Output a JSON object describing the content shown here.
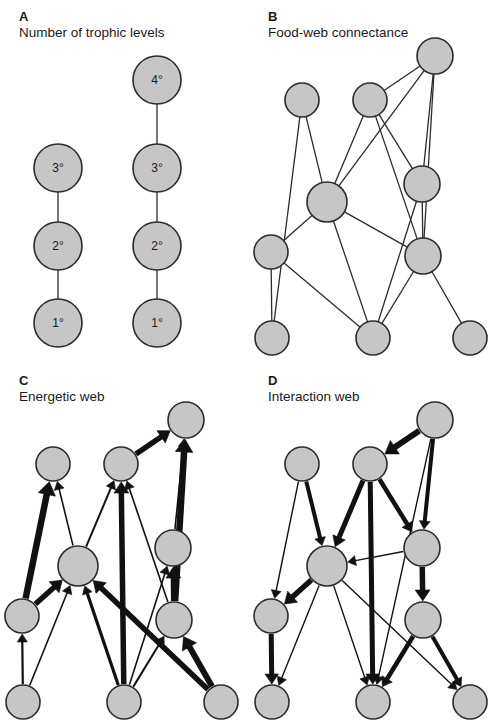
{
  "figure": {
    "background": "#ffffff",
    "node_fill": "#c6c6c6",
    "node_stroke": "#2b2b2b",
    "link_color": "#2b2b2b",
    "arrow_color": "#111111"
  },
  "panels": [
    {
      "id": "a",
      "letter": "A",
      "caption": "Number of trophic levels",
      "type": "trophic-chains",
      "nodes": [
        {
          "id": "a1",
          "cx": 58,
          "cy": 168,
          "r": 24,
          "label": "3°"
        },
        {
          "id": "a2",
          "cx": 58,
          "cy": 246,
          "r": 24,
          "label": "2°"
        },
        {
          "id": "a3",
          "cx": 58,
          "cy": 323,
          "r": 24,
          "label": "1°"
        },
        {
          "id": "b1",
          "cx": 157,
          "cy": 80,
          "r": 24,
          "label": "4°"
        },
        {
          "id": "b2",
          "cx": 157,
          "cy": 168,
          "r": 24,
          "label": "3°"
        },
        {
          "id": "b3",
          "cx": 157,
          "cy": 246,
          "r": 24,
          "label": "2°"
        },
        {
          "id": "b4",
          "cx": 157,
          "cy": 323,
          "r": 24,
          "label": "1°"
        }
      ],
      "links": [
        {
          "from": "a1",
          "to": "a2"
        },
        {
          "from": "a2",
          "to": "a3"
        },
        {
          "from": "b1",
          "to": "b2"
        },
        {
          "from": "b2",
          "to": "b3"
        },
        {
          "from": "b3",
          "to": "b4"
        }
      ]
    },
    {
      "id": "b",
      "letter": "B",
      "caption": "Food-web connectance",
      "type": "undirected-web",
      "nodes": [
        {
          "id": "n1",
          "cx": 53,
          "cy": 100,
          "r": 17
        },
        {
          "id": "n2",
          "cx": 121,
          "cy": 100,
          "r": 17
        },
        {
          "id": "n3",
          "cx": 186,
          "cy": 56,
          "r": 18
        },
        {
          "id": "n4",
          "cx": 78,
          "cy": 202,
          "r": 20
        },
        {
          "id": "n5",
          "cx": 173,
          "cy": 184,
          "r": 18
        },
        {
          "id": "n6",
          "cx": 22,
          "cy": 252,
          "r": 17
        },
        {
          "id": "n7",
          "cx": 174,
          "cy": 256,
          "r": 18
        },
        {
          "id": "n8",
          "cx": 23,
          "cy": 338,
          "r": 17
        },
        {
          "id": "n9",
          "cx": 124,
          "cy": 338,
          "r": 17
        },
        {
          "id": "n10",
          "cx": 221,
          "cy": 338,
          "r": 17
        }
      ],
      "links": [
        {
          "from": "n1",
          "to": "n4"
        },
        {
          "from": "n1",
          "to": "n8"
        },
        {
          "from": "n2",
          "to": "n3"
        },
        {
          "from": "n2",
          "to": "n4"
        },
        {
          "from": "n2",
          "to": "n7"
        },
        {
          "from": "n2",
          "to": "n5"
        },
        {
          "from": "n3",
          "to": "n4"
        },
        {
          "from": "n3",
          "to": "n5"
        },
        {
          "from": "n3",
          "to": "n7"
        },
        {
          "from": "n4",
          "to": "n6"
        },
        {
          "from": "n4",
          "to": "n9"
        },
        {
          "from": "n4",
          "to": "n7"
        },
        {
          "from": "n5",
          "to": "n7"
        },
        {
          "from": "n5",
          "to": "n9"
        },
        {
          "from": "n6",
          "to": "n8"
        },
        {
          "from": "n6",
          "to": "n9"
        },
        {
          "from": "n7",
          "to": "n9"
        },
        {
          "from": "n7",
          "to": "n10"
        }
      ]
    },
    {
      "id": "c",
      "letter": "C",
      "caption": "Energetic web",
      "type": "directed-web",
      "direction": "upward",
      "nodes": [
        {
          "id": "n1",
          "cx": 53,
          "cy": 100,
          "r": 17
        },
        {
          "id": "n2",
          "cx": 121,
          "cy": 100,
          "r": 17
        },
        {
          "id": "n3",
          "cx": 186,
          "cy": 56,
          "r": 18
        },
        {
          "id": "n4",
          "cx": 78,
          "cy": 202,
          "r": 20
        },
        {
          "id": "n5",
          "cx": 173,
          "cy": 184,
          "r": 18
        },
        {
          "id": "n6",
          "cx": 22,
          "cy": 252,
          "r": 17
        },
        {
          "id": "n7",
          "cx": 174,
          "cy": 256,
          "r": 18
        },
        {
          "id": "n8",
          "cx": 23,
          "cy": 338,
          "r": 17
        },
        {
          "id": "n9",
          "cx": 124,
          "cy": 338,
          "r": 17
        },
        {
          "id": "n10",
          "cx": 221,
          "cy": 338,
          "r": 17
        }
      ],
      "arrows": [
        {
          "from": "n6",
          "to": "n1",
          "weight": 6.5
        },
        {
          "from": "n4",
          "to": "n1",
          "weight": 1.6
        },
        {
          "from": "n8",
          "to": "n6",
          "weight": 2.2
        },
        {
          "from": "n4",
          "to": "n2",
          "weight": 2.0
        },
        {
          "from": "n9",
          "to": "n2",
          "weight": 5.5
        },
        {
          "from": "n7",
          "to": "n2",
          "weight": 1.6
        },
        {
          "from": "n2",
          "to": "n3",
          "weight": 5.5
        },
        {
          "from": "n5",
          "to": "n3",
          "weight": 1.6
        },
        {
          "from": "n7",
          "to": "n3",
          "weight": 6.5
        },
        {
          "from": "n6",
          "to": "n4",
          "weight": 5.5
        },
        {
          "from": "n8",
          "to": "n4",
          "weight": 1.6
        },
        {
          "from": "n9",
          "to": "n4",
          "weight": 3.2
        },
        {
          "from": "n10",
          "to": "n4",
          "weight": 5.5
        },
        {
          "from": "n7",
          "to": "n5",
          "weight": 5.5
        },
        {
          "from": "n9",
          "to": "n5",
          "weight": 1.6
        },
        {
          "from": "n9",
          "to": "n7",
          "weight": 2.0
        },
        {
          "from": "n10",
          "to": "n7",
          "weight": 6.0
        }
      ]
    },
    {
      "id": "d",
      "letter": "D",
      "caption": "Interaction web",
      "type": "directed-web",
      "direction": "downward",
      "nodes": [
        {
          "id": "n1",
          "cx": 53,
          "cy": 100,
          "r": 17
        },
        {
          "id": "n2",
          "cx": 121,
          "cy": 100,
          "r": 17
        },
        {
          "id": "n3",
          "cx": 186,
          "cy": 56,
          "r": 18
        },
        {
          "id": "n4",
          "cx": 78,
          "cy": 202,
          "r": 20
        },
        {
          "id": "n5",
          "cx": 173,
          "cy": 184,
          "r": 18
        },
        {
          "id": "n6",
          "cx": 22,
          "cy": 252,
          "r": 17
        },
        {
          "id": "n7",
          "cx": 174,
          "cy": 256,
          "r": 18
        },
        {
          "id": "n8",
          "cx": 23,
          "cy": 338,
          "r": 17
        },
        {
          "id": "n9",
          "cx": 124,
          "cy": 338,
          "r": 17
        },
        {
          "id": "n10",
          "cx": 221,
          "cy": 338,
          "r": 17
        }
      ],
      "arrows": [
        {
          "from": "n3",
          "to": "n2",
          "weight": 6.0
        },
        {
          "from": "n1",
          "to": "n4",
          "weight": 4.0
        },
        {
          "from": "n1",
          "to": "n6",
          "weight": 1.4
        },
        {
          "from": "n2",
          "to": "n4",
          "weight": 5.0
        },
        {
          "from": "n2",
          "to": "n5",
          "weight": 4.5
        },
        {
          "from": "n2",
          "to": "n9",
          "weight": 5.0
        },
        {
          "from": "n3",
          "to": "n5",
          "weight": 4.0
        },
        {
          "from": "n3",
          "to": "n9",
          "weight": 1.4
        },
        {
          "from": "n5",
          "to": "n7",
          "weight": 5.5
        },
        {
          "from": "n5",
          "to": "n4",
          "weight": 1.4
        },
        {
          "from": "n4",
          "to": "n6",
          "weight": 5.5
        },
        {
          "from": "n4",
          "to": "n8",
          "weight": 1.4
        },
        {
          "from": "n4",
          "to": "n9",
          "weight": 1.4
        },
        {
          "from": "n4",
          "to": "n10",
          "weight": 1.4
        },
        {
          "from": "n6",
          "to": "n8",
          "weight": 5.0
        },
        {
          "from": "n7",
          "to": "n9",
          "weight": 4.5
        },
        {
          "from": "n7",
          "to": "n10",
          "weight": 4.0
        }
      ]
    }
  ]
}
